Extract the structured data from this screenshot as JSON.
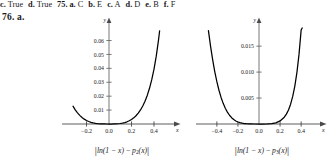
{
  "answer_line": {
    "leading_answers": [
      {
        "label": "c.",
        "value": "True"
      },
      {
        "label": "d.",
        "value": "True"
      }
    ],
    "question_number": "75.",
    "answers": [
      {
        "label": "a.",
        "value": "C"
      },
      {
        "label": "b.",
        "value": "E"
      },
      {
        "label": "c.",
        "value": "A"
      },
      {
        "label": "d.",
        "value": "D"
      },
      {
        "label": "e.",
        "value": "B"
      },
      {
        "label": "f.",
        "value": "F"
      }
    ]
  },
  "problem": {
    "number": "76.",
    "part": "a."
  },
  "figures": [
    {
      "name": "left-plot",
      "caption": {
        "function": "ln(1 − x)",
        "minus": "−",
        "poly": "p",
        "poly_subscript": "2",
        "poly_arg": "(x)"
      },
      "axis": {
        "x_label": "x",
        "y_label": "y",
        "x_ticks": [
          "−0.2",
          "0.0",
          "0.2",
          "0.4"
        ],
        "x_tick_values": [
          -0.2,
          0.0,
          0.2,
          0.4
        ],
        "y_ticks": [
          "0.01",
          "0.02",
          "0.03",
          "0.04",
          "0.05",
          "0.06"
        ],
        "y_tick_values": [
          0.01,
          0.02,
          0.03,
          0.04,
          0.05,
          0.06
        ],
        "x_range": [
          -0.32,
          0.56
        ],
        "y_range": [
          0,
          0.069
        ]
      },
      "curve": {
        "description": "absolute error |ln(1-x) - p2(x)|, U-shaped minimum at x=0",
        "points": [
          [
            -0.32,
            0.0128
          ],
          [
            -0.3,
            0.0102
          ],
          [
            -0.28,
            0.008
          ],
          [
            -0.26,
            0.0062
          ],
          [
            -0.24,
            0.0047
          ],
          [
            -0.22,
            0.0035
          ],
          [
            -0.2,
            0.0025
          ],
          [
            -0.18,
            0.0018
          ],
          [
            -0.16,
            0.0012
          ],
          [
            -0.14,
            0.00079
          ],
          [
            -0.12,
            0.00048
          ],
          [
            -0.1,
            0.00027
          ],
          [
            -0.08,
            0.00013
          ],
          [
            -0.06,
            5e-05
          ],
          [
            -0.04,
            2e-05
          ],
          [
            -0.02,
            2e-06
          ],
          [
            0.0,
            0.0
          ],
          [
            0.02,
            3e-06
          ],
          [
            0.04,
            2e-05
          ],
          [
            0.06,
            7e-05
          ],
          [
            0.08,
            0.00018
          ],
          [
            0.1,
            0.00036
          ],
          [
            0.12,
            0.00064
          ],
          [
            0.14,
            0.00104
          ],
          [
            0.16,
            0.00158
          ],
          [
            0.18,
            0.0023
          ],
          [
            0.2,
            0.00324
          ],
          [
            0.22,
            0.00443
          ],
          [
            0.24,
            0.00593
          ],
          [
            0.26,
            0.0078
          ],
          [
            0.28,
            0.0101
          ],
          [
            0.3,
            0.01292
          ],
          [
            0.32,
            0.01636
          ],
          [
            0.34,
            0.02055
          ],
          [
            0.36,
            0.02565
          ],
          [
            0.38,
            0.03186
          ],
          [
            0.4,
            0.03944
          ],
          [
            0.42,
            0.04875
          ],
          [
            0.44,
            0.06026
          ],
          [
            0.45,
            0.067
          ]
        ]
      }
    },
    {
      "name": "right-plot",
      "caption": {
        "function": "ln(1 − x)",
        "minus": "−",
        "poly": "p",
        "poly_subscript": "3",
        "poly_arg": "(x)"
      },
      "axis": {
        "x_label": "x",
        "y_label": "y",
        "x_ticks": [
          "−0.4",
          "−0.2",
          "0.0",
          "0.2",
          "0.4"
        ],
        "x_tick_values": [
          -0.4,
          -0.2,
          0.0,
          0.2,
          0.4
        ],
        "y_ticks": [
          "0.005",
          "0.010",
          "0.015"
        ],
        "y_tick_values": [
          0.005,
          0.01,
          0.015
        ],
        "x_range": [
          -0.48,
          0.56
        ],
        "y_range": [
          0,
          0.0185
        ]
      },
      "curve": {
        "description": "absolute error |ln(1-x) - p3(x)|, U-shaped minimum at x=0",
        "points": [
          [
            -0.48,
            0.018
          ],
          [
            -0.46,
            0.015
          ],
          [
            -0.44,
            0.0124
          ],
          [
            -0.42,
            0.0101
          ],
          [
            -0.4,
            0.00815
          ],
          [
            -0.38,
            0.0065
          ],
          [
            -0.36,
            0.00512
          ],
          [
            -0.34,
            0.00398
          ],
          [
            -0.32,
            0.00304
          ],
          [
            -0.3,
            0.00229
          ],
          [
            -0.28,
            0.00169
          ],
          [
            -0.26,
            0.00122
          ],
          [
            -0.24,
            0.00086
          ],
          [
            -0.22,
            0.00059
          ],
          [
            -0.2,
            0.00039
          ],
          [
            -0.18,
            0.00025
          ],
          [
            -0.16,
            0.00015
          ],
          [
            -0.14,
            9e-05
          ],
          [
            -0.12,
            5e-05
          ],
          [
            -0.1,
            2e-05
          ],
          [
            -0.08,
            1e-05
          ],
          [
            -0.04,
            6e-07
          ],
          [
            0.0,
            0.0
          ],
          [
            0.04,
            7e-07
          ],
          [
            0.08,
            1e-05
          ],
          [
            0.12,
            7e-05
          ],
          [
            0.16,
            0.00023
          ],
          [
            0.2,
            0.00059
          ],
          [
            0.24,
            0.00131
          ],
          [
            0.26,
            0.0019
          ],
          [
            0.28,
            0.00271
          ],
          [
            0.3,
            0.00382
          ],
          [
            0.32,
            0.00531
          ],
          [
            0.34,
            0.0073
          ],
          [
            0.36,
            0.00995
          ],
          [
            0.38,
            0.01346
          ],
          [
            0.4,
            0.0181
          ],
          [
            0.41,
            0.0185
          ]
        ]
      }
    }
  ]
}
